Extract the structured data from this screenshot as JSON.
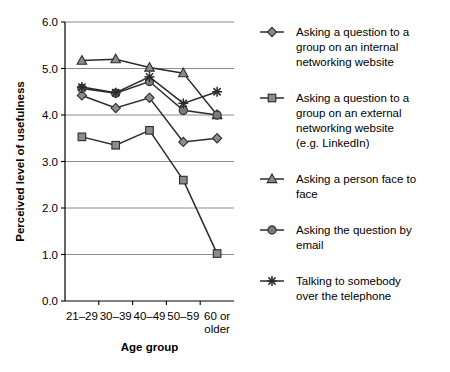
{
  "chart_data": {
    "type": "line",
    "title": "",
    "xlabel": "Age group",
    "ylabel": "Perceived level of usefulness",
    "categories": [
      "21–29",
      "30–39",
      "40–49",
      "50–59",
      "60 or older"
    ],
    "category_lines": [
      [
        "21–29"
      ],
      [
        "30–39"
      ],
      [
        "40–49"
      ],
      [
        "50–59"
      ],
      [
        "60 or",
        "older"
      ]
    ],
    "ylim": [
      0.0,
      6.0
    ],
    "ytick_labels": [
      "0.0",
      "1.0",
      "2.0",
      "3.0",
      "4.0",
      "5.0",
      "6.0"
    ],
    "ytick_values": [
      0.0,
      1.0,
      2.0,
      3.0,
      4.0,
      5.0,
      6.0
    ],
    "grid": "horizontal",
    "legend_position": "right",
    "series": [
      {
        "name": "Asking a question to a group on an internal networking website",
        "legend_lines": [
          "Asking a question to a",
          "group on an internal",
          "networking website"
        ],
        "marker": "diamond",
        "color": "#8c8c8c",
        "values": [
          4.42,
          4.15,
          4.37,
          3.42,
          3.5
        ]
      },
      {
        "name": "Asking a question to a group on an external networking website (e.g. LinkedIn)",
        "legend_lines": [
          "Asking a question to a",
          "group on an external",
          "networking website",
          "(e.g. LinkedIn)"
        ],
        "marker": "square",
        "color": "#8c8c8c",
        "values": [
          3.53,
          3.35,
          3.67,
          2.6,
          1.02
        ]
      },
      {
        "name": "Asking a person face to face",
        "legend_lines": [
          "Asking a person face to",
          "face"
        ],
        "marker": "triangle",
        "color": "#8c8c8c",
        "values": [
          5.17,
          5.2,
          5.02,
          4.9,
          4.0
        ]
      },
      {
        "name": "Asking the question by email",
        "legend_lines": [
          "Asking the question by",
          "email"
        ],
        "marker": "circle",
        "color": "#7a7a7a",
        "values": [
          4.57,
          4.47,
          4.72,
          4.1,
          4.0
        ]
      },
      {
        "name": "Talking to somebody over the telephone",
        "legend_lines": [
          "Talking to somebody",
          "over the telephone"
        ],
        "marker": "star",
        "color": "#2b2b2b",
        "values": [
          4.6,
          4.48,
          4.82,
          4.25,
          4.5
        ]
      }
    ]
  }
}
